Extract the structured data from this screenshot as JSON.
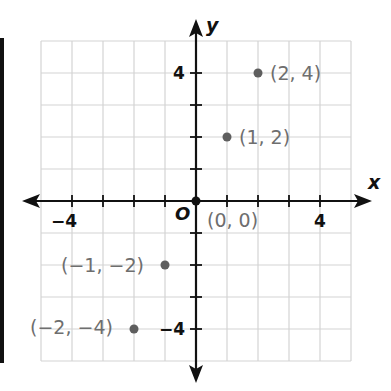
{
  "chart_data": {
    "type": "scatter",
    "title": "",
    "xlabel": "x",
    "ylabel": "y",
    "origin_label": "O",
    "xlim": [
      -5,
      5
    ],
    "ylim": [
      -5,
      5
    ],
    "grid": true,
    "x_tick_labels": [
      {
        "value": -4,
        "label": "−4"
      },
      {
        "value": 4,
        "label": "4"
      }
    ],
    "y_tick_labels": [
      {
        "value": 4,
        "label": "4"
      },
      {
        "value": -4,
        "label": "−4"
      }
    ],
    "series": [
      {
        "name": "points",
        "points": [
          {
            "x": -2,
            "y": -4,
            "label": "(−2, −4)"
          },
          {
            "x": -1,
            "y": -2,
            "label": "(−1, −2)"
          },
          {
            "x": 0,
            "y": 0,
            "label": "(0, 0)"
          },
          {
            "x": 1,
            "y": 2,
            "label": "(1, 2)"
          },
          {
            "x": 2,
            "y": 4,
            "label": "(2, 4)"
          }
        ]
      }
    ],
    "colors": {
      "point": "#5e5e5e",
      "axis": "#111111",
      "grid": "#d4d4d4",
      "label": "#6e6e6e"
    }
  }
}
